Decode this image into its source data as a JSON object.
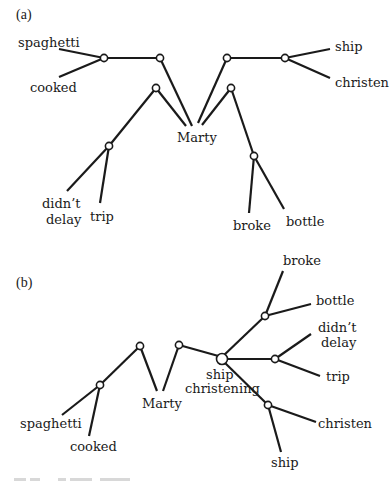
{
  "figure": {
    "panels": [
      {
        "id": "a",
        "label": "(a)",
        "leaves": {
          "spaghetti": "spaghetti",
          "cooked": "cooked",
          "didnt_delay_1": "didn’t",
          "didnt_delay_2": "delay",
          "trip": "trip",
          "marty": "Marty",
          "ship": "ship",
          "christen": "christen",
          "broke": "broke",
          "bottle": "bottle"
        }
      },
      {
        "id": "b",
        "label": "(b)",
        "leaves": {
          "spaghetti": "spaghetti",
          "cooked": "cooked",
          "marty": "Marty",
          "center_1": "ship",
          "center_2": "christening",
          "broke": "broke",
          "bottle": "bottle",
          "didnt_delay_1": "didn’t",
          "didnt_delay_2": "delay",
          "trip": "trip",
          "christen": "christen",
          "ship": "ship"
        }
      }
    ]
  }
}
